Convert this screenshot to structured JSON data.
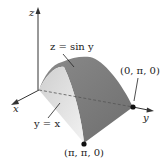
{
  "diagram": {
    "surface_label": "z = sin y",
    "plane_label": "y = x",
    "axes": {
      "x": "x",
      "y": "y",
      "z": "z"
    },
    "points": [
      {
        "label": "(0, π, 0)"
      },
      {
        "label": "(π, π, 0)"
      }
    ]
  }
}
